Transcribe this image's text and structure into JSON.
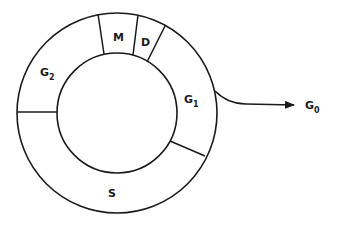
{
  "diagram": {
    "phases": [
      {
        "id": "M",
        "label": "M",
        "sub": ""
      },
      {
        "id": "D",
        "label": "D",
        "sub": ""
      },
      {
        "id": "G1",
        "label": "G",
        "sub": "1"
      },
      {
        "id": "S",
        "label": "S",
        "sub": ""
      },
      {
        "id": "G2",
        "label": "G",
        "sub": "2"
      }
    ],
    "exit": {
      "label": "G",
      "sub": "0"
    },
    "colors": {
      "stroke": "#1a1a1a",
      "background": "#ffffff"
    }
  }
}
